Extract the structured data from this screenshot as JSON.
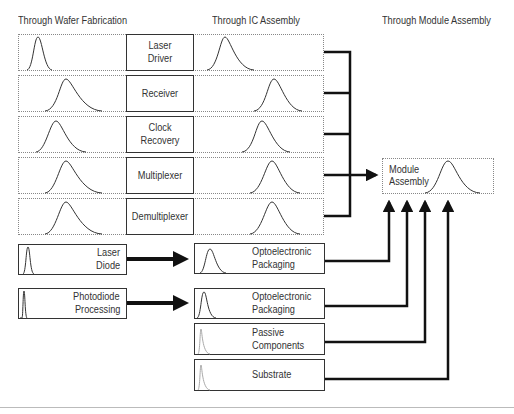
{
  "headers": {
    "wafer": "Through Wafer Fabrication",
    "ic": "Through IC Assembly",
    "module": "Through Module Assembly"
  },
  "ic_rows": [
    {
      "label_line1": "Laser",
      "label_line2": "Driver"
    },
    {
      "label_line1": "Receiver",
      "label_line2": ""
    },
    {
      "label_line1": "Clock",
      "label_line2": "Recovery"
    },
    {
      "label_line1": "Multiplexer",
      "label_line2": ""
    },
    {
      "label_line1": "Demultiplexer",
      "label_line2": ""
    }
  ],
  "module": {
    "label_line1": "Module",
    "label_line2": "Assembly"
  },
  "optical_sources": [
    {
      "label_line1": "Laser",
      "label_line2": "Diode"
    },
    {
      "label_line1": "Photodiode",
      "label_line2": "Processing"
    }
  ],
  "packaging": [
    {
      "label_line1": "Optoelectronic",
      "label_line2": "Packaging"
    },
    {
      "label_line1": "Optoelectronic",
      "label_line2": "Packaging"
    },
    {
      "label_line1": "Passive",
      "label_line2": "Components"
    },
    {
      "label_line1": "Substrate",
      "label_line2": ""
    }
  ],
  "colors": {
    "line": "#111111",
    "curve": "#333333",
    "faint_curve": "#aaaaaa",
    "dotted_border": "#888888"
  }
}
